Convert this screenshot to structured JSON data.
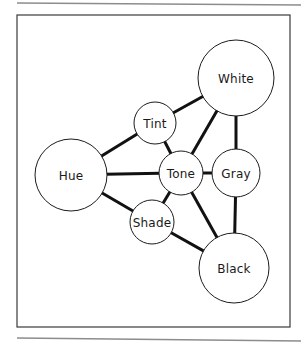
{
  "figure": {
    "kind": "node-link-diagram",
    "topic": "color-terms-relationship",
    "frame": {
      "x": 17,
      "y": 15,
      "width": 273,
      "height": 312
    },
    "rules": [
      {
        "name": "top-rule",
        "x1": 17,
        "y1": 3,
        "x2": 301,
        "y2": 5
      },
      {
        "name": "bottom-rule",
        "x1": 17,
        "y1": 338,
        "x2": 301,
        "y2": 341
      }
    ],
    "nodes": [
      {
        "id": "white",
        "label": "White",
        "cx": 236,
        "cy": 78,
        "r": 38,
        "font_size": 12.5
      },
      {
        "id": "tint",
        "label": "Tint",
        "cx": 155,
        "cy": 123,
        "r": 21,
        "font_size": 11.5
      },
      {
        "id": "hue",
        "label": "Hue",
        "cx": 71,
        "cy": 175,
        "r": 36,
        "font_size": 12.5
      },
      {
        "id": "tone",
        "label": "Tone",
        "cx": 181,
        "cy": 173,
        "r": 22,
        "font_size": 11.5
      },
      {
        "id": "gray",
        "label": "Gray",
        "cx": 236,
        "cy": 173,
        "r": 24,
        "font_size": 11.5
      },
      {
        "id": "shade",
        "label": "Shade",
        "cx": 152,
        "cy": 222,
        "r": 22,
        "font_size": 11.5
      },
      {
        "id": "black",
        "label": "Black",
        "cx": 234,
        "cy": 268,
        "r": 35,
        "font_size": 12.5
      }
    ],
    "edges": [
      {
        "id": "tint-white",
        "from": "tint",
        "to": "white"
      },
      {
        "id": "tint-hue",
        "from": "tint",
        "to": "hue"
      },
      {
        "id": "tint-tone",
        "from": "tint",
        "to": "tone"
      },
      {
        "id": "white-tone",
        "from": "white",
        "to": "tone"
      },
      {
        "id": "white-gray",
        "from": "white",
        "to": "gray"
      },
      {
        "id": "hue-tone",
        "from": "hue",
        "to": "tone"
      },
      {
        "id": "hue-shade",
        "from": "hue",
        "to": "shade"
      },
      {
        "id": "tone-gray",
        "from": "tone",
        "to": "gray"
      },
      {
        "id": "tone-shade",
        "from": "tone",
        "to": "shade"
      },
      {
        "id": "tone-black",
        "from": "tone",
        "to": "black"
      },
      {
        "id": "shade-black",
        "from": "shade",
        "to": "black"
      },
      {
        "id": "gray-black",
        "from": "gray",
        "to": "black"
      }
    ],
    "colors": {
      "node_fill": "#ffffff",
      "node_stroke": "#1c1c1c",
      "edge_stroke": "#111111",
      "frame_stroke": "#3a3a3a",
      "rule_stroke": "#8c8c8c",
      "label_color": "#1a1a1a",
      "background": "#ffffff"
    }
  }
}
